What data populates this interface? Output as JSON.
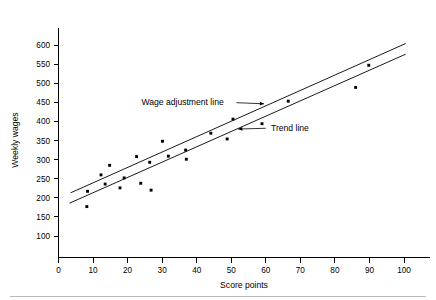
{
  "chart_data": {
    "type": "scatter",
    "title": "",
    "subtitle": "",
    "xlabel": "Score points",
    "ylabel": "Weekly wages",
    "xlim": [
      0,
      105
    ],
    "ylim": [
      75,
      625
    ],
    "grid": false,
    "legend_position": "none",
    "x_ticks": [
      0,
      10,
      20,
      30,
      40,
      50,
      60,
      70,
      80,
      90,
      100
    ],
    "x_tick_labels": [
      "0",
      "10",
      "20",
      "30",
      "40",
      "50",
      "60",
      "70",
      "80",
      "90",
      "100"
    ],
    "y_ticks": [
      100,
      150,
      200,
      250,
      300,
      350,
      400,
      450,
      500,
      550,
      600
    ],
    "y_tick_labels": [
      "100",
      "150",
      "200",
      "250",
      "300",
      "350",
      "400",
      "450",
      "500",
      "550",
      "600"
    ],
    "series": [
      {
        "name": "Observations",
        "type": "scatter",
        "marker": "square",
        "color": "#000000",
        "points": [
          {
            "x": 8.2,
            "y": 177
          },
          {
            "x": 8.4,
            "y": 217
          },
          {
            "x": 12.3,
            "y": 260
          },
          {
            "x": 13.5,
            "y": 236
          },
          {
            "x": 14.8,
            "y": 285
          },
          {
            "x": 17.8,
            "y": 226
          },
          {
            "x": 19.0,
            "y": 252
          },
          {
            "x": 22.6,
            "y": 308
          },
          {
            "x": 23.8,
            "y": 238
          },
          {
            "x": 26.4,
            "y": 293
          },
          {
            "x": 26.8,
            "y": 220
          },
          {
            "x": 30.1,
            "y": 348
          },
          {
            "x": 31.8,
            "y": 309
          },
          {
            "x": 36.8,
            "y": 325
          },
          {
            "x": 37.0,
            "y": 301
          },
          {
            "x": 44.1,
            "y": 369
          },
          {
            "x": 48.8,
            "y": 354
          },
          {
            "x": 50.5,
            "y": 406
          },
          {
            "x": 58.9,
            "y": 394
          },
          {
            "x": 66.5,
            "y": 453
          },
          {
            "x": 86.0,
            "y": 489
          },
          {
            "x": 89.8,
            "y": 547
          }
        ]
      },
      {
        "name": "Wage adjustment line",
        "type": "line",
        "color": "#000000",
        "points": [
          {
            "x": 3.5,
            "y": 213
          },
          {
            "x": 100.5,
            "y": 604
          }
        ]
      },
      {
        "name": "Trend line",
        "type": "line",
        "color": "#000000",
        "points": [
          {
            "x": 3.2,
            "y": 186
          },
          {
            "x": 100.5,
            "y": 576
          }
        ]
      }
    ],
    "annotations": [
      {
        "name": "wage-adjustment-line",
        "text": "Wage adjustment line",
        "text_x": 24.0,
        "text_y": 452,
        "arrow_from_x": 51.5,
        "arrow_from_y": 449,
        "arrow_to_x": 59.5,
        "arrow_to_y": 446,
        "arrow_direction": "right"
      },
      {
        "name": "trend-line",
        "text": "Trend line",
        "text_x": 61.5,
        "text_y": 382,
        "arrow_from_x": 60.0,
        "arrow_from_y": 382,
        "arrow_to_x": 52.0,
        "arrow_to_y": 380,
        "arrow_direction": "left"
      }
    ]
  }
}
